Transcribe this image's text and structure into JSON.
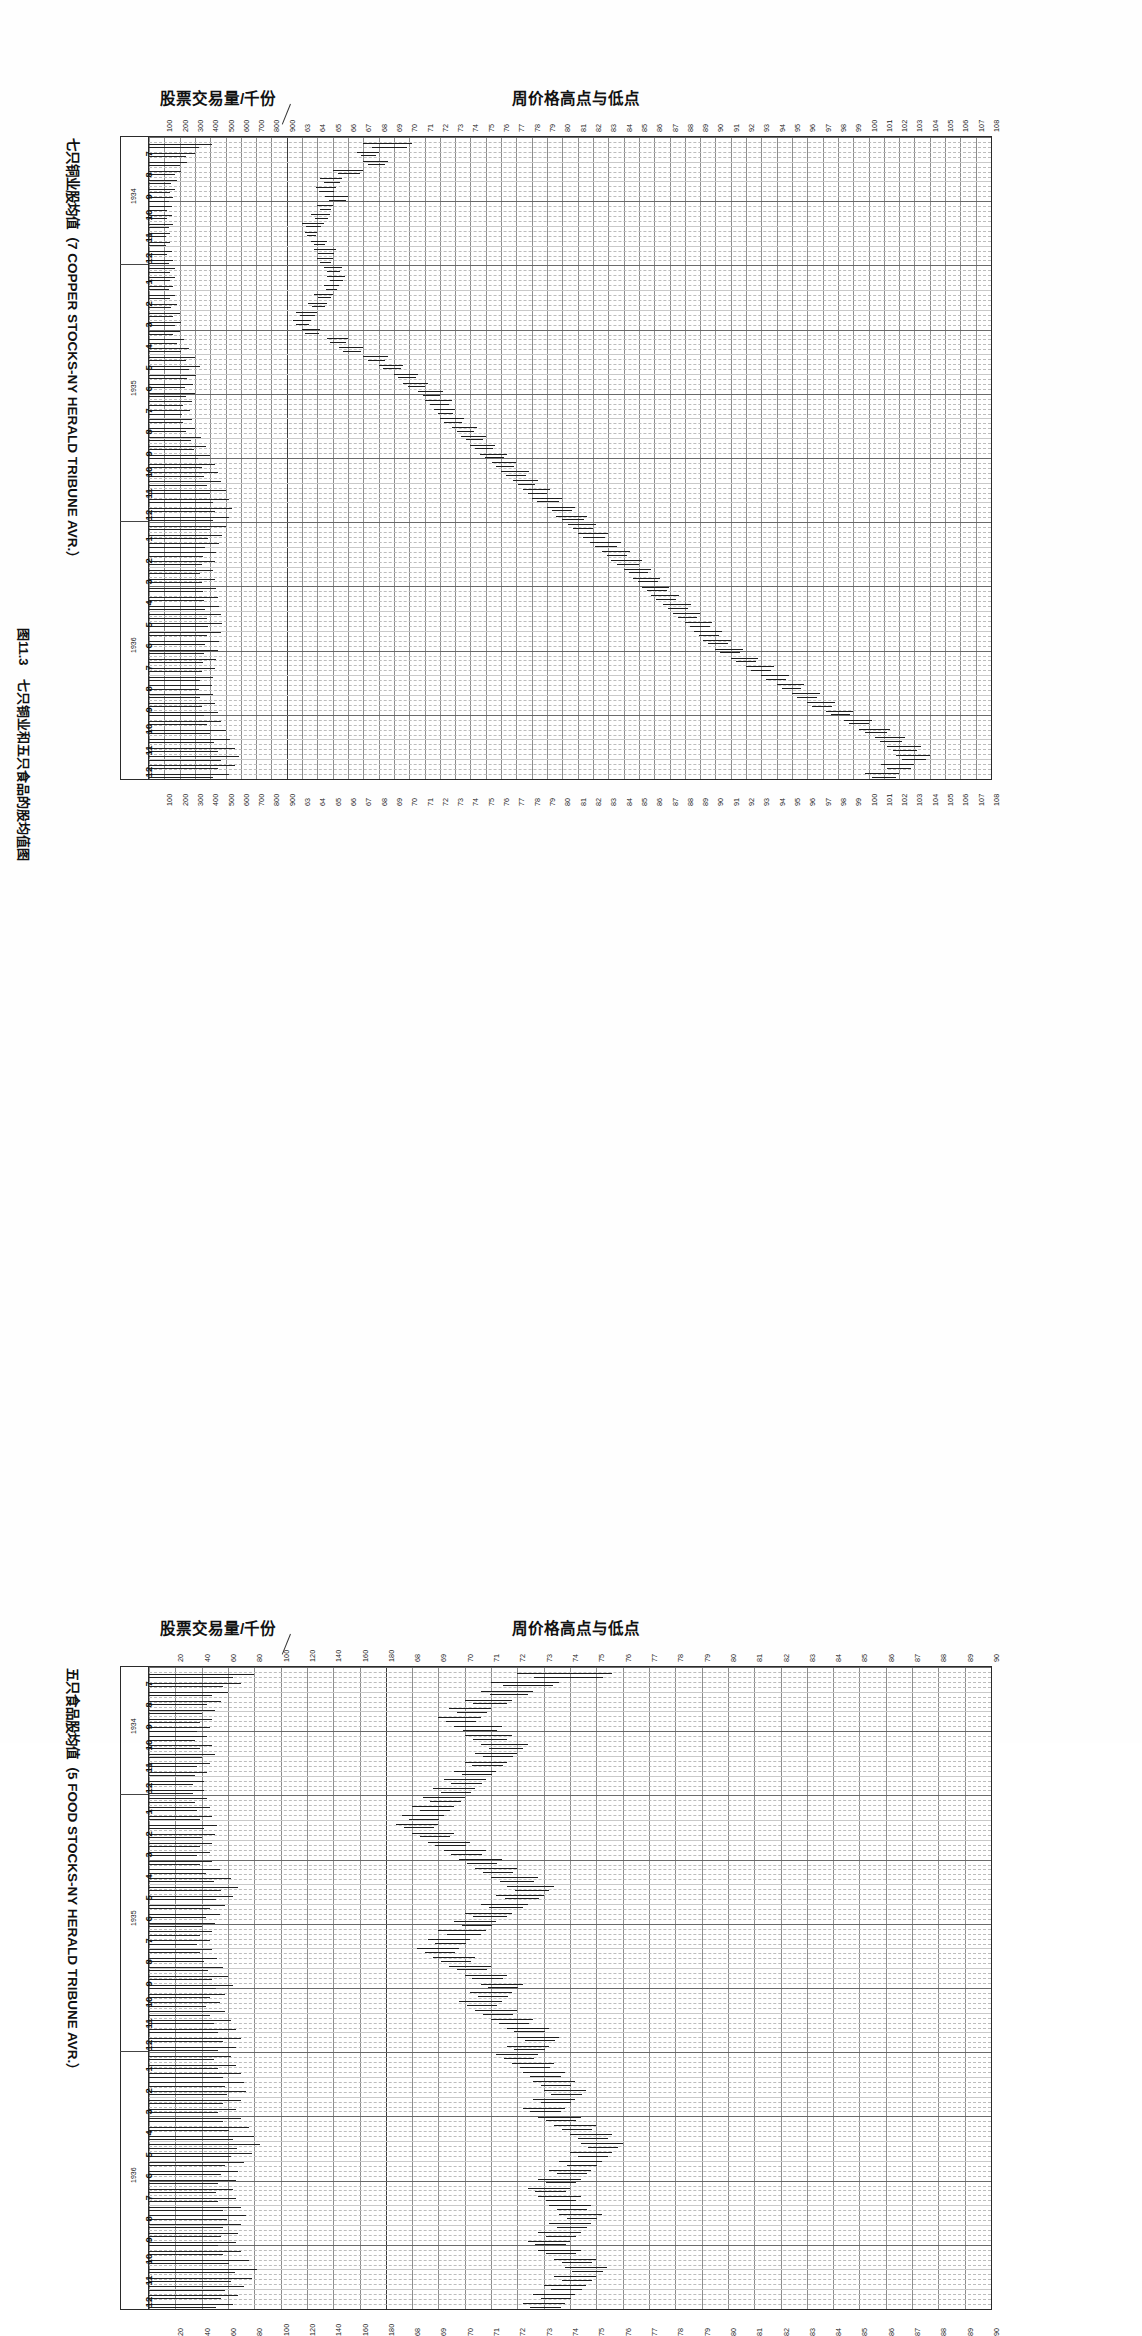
{
  "figure": {
    "caption": "图11.3　七只铜业和五只食品的股均值图",
    "volume_axis_title": "股票交易量/千份",
    "price_axis_title": "周价格高点与低点"
  },
  "charts": [
    {
      "id": "copper",
      "side_title": "七只铜业股均值（7 COPPER STOCKS-NY HERALD TRIBUNE AVR.）",
      "volume_axis_title": "股票交易量/千份",
      "price_axis_title": "周价格高点与低点",
      "volume_ticks": [
        "100",
        "200",
        "300",
        "400",
        "500",
        "600",
        "700",
        "800",
        "900"
      ],
      "price_ticks": [
        "63",
        "64",
        "65",
        "66",
        "67",
        "68",
        "69",
        "70",
        "71",
        "72",
        "73",
        "74",
        "75",
        "76",
        "77",
        "78",
        "79",
        "80",
        "81",
        "82",
        "83",
        "84",
        "85",
        "86",
        "87",
        "88",
        "89",
        "90",
        "91",
        "92",
        "93",
        "94",
        "95",
        "96",
        "97",
        "98",
        "99",
        "100",
        "101",
        "102",
        "103",
        "104",
        "105",
        "106",
        "107",
        "108"
      ],
      "years": [
        "1934",
        "1935",
        "1936"
      ],
      "month_labels_1934": [
        "7",
        "8",
        "9",
        "10",
        "11",
        "12"
      ],
      "month_labels_1935": [
        "1",
        "2",
        "3",
        "4",
        "5",
        "6",
        "7",
        "8",
        "9",
        "10",
        "11",
        "12"
      ],
      "month_labels_1936": [
        "1",
        "2",
        "3",
        "4",
        "5",
        "6",
        "7",
        "8",
        "9",
        "10",
        "11",
        "12"
      ]
    },
    {
      "id": "food",
      "side_title": "五只食品股均值（5 FOOD STOCKS-NY HERALD TRIBUNE AVR.）",
      "volume_axis_title": "股票交易量/千份",
      "price_axis_title": "周价格高点与低点",
      "volume_ticks": [
        "20",
        "40",
        "60",
        "80",
        "100",
        "120",
        "140",
        "160",
        "180"
      ],
      "price_ticks": [
        "68",
        "69",
        "70",
        "71",
        "72",
        "73",
        "74",
        "75",
        "76",
        "77",
        "78",
        "79",
        "80",
        "81",
        "82",
        "83",
        "84",
        "85",
        "86",
        "87",
        "88",
        "89",
        "90"
      ],
      "years": [
        "1934",
        "1935",
        "1936"
      ],
      "month_labels_1934": [
        "7",
        "8",
        "9",
        "10",
        "11",
        "12"
      ],
      "month_labels_1935": [
        "1",
        "2",
        "3",
        "4",
        "5",
        "6",
        "7",
        "8",
        "9",
        "10",
        "11",
        "12"
      ],
      "month_labels_1936": [
        "1",
        "2",
        "3",
        "4",
        "5",
        "6",
        "7",
        "8",
        "9",
        "10",
        "11",
        "12"
      ]
    }
  ],
  "chart_data": [
    {
      "type": "bar",
      "id": "copper",
      "title": "七只铜业股均值（7 COPPER STOCKS-NY HERALD TRIBUNE AVR.）",
      "subtitle": "Weekly price highs and lows with share volume",
      "xlabel": "周价格高点与低点",
      "ylabel": "日期（月/年）",
      "orientation": "horizontal-time-down",
      "grid": true,
      "legend": "none",
      "price_axis_label": "周价格高点与低点",
      "price_range": [
        63,
        108
      ],
      "volume_axis_label": "股票交易量/千份",
      "volume_range": [
        0,
        900
      ],
      "time_range": [
        "1934-07",
        "1936-12"
      ],
      "weekly_bars": [
        {
          "w": 1,
          "low": 68.0,
          "high": 71.2,
          "vol": 410
        },
        {
          "w": 2,
          "low": 67.6,
          "high": 69.0,
          "vol": 300
        },
        {
          "w": 3,
          "low": 68.0,
          "high": 69.6,
          "vol": 250
        },
        {
          "w": 4,
          "low": 66.0,
          "high": 68.0,
          "vol": 210
        },
        {
          "w": 5,
          "low": 65.2,
          "high": 66.6,
          "vol": 180
        },
        {
          "w": 6,
          "low": 64.9,
          "high": 66.2,
          "vol": 170
        },
        {
          "w": 7,
          "low": 65.5,
          "high": 67.0,
          "vol": 160
        },
        {
          "w": 8,
          "low": 65.0,
          "high": 66.0,
          "vol": 150
        },
        {
          "w": 9,
          "low": 64.6,
          "high": 65.8,
          "vol": 150
        },
        {
          "w": 10,
          "low": 64.0,
          "high": 65.4,
          "vol": 160
        },
        {
          "w": 11,
          "low": 64.2,
          "high": 65.0,
          "vol": 140
        },
        {
          "w": 12,
          "low": 64.6,
          "high": 65.6,
          "vol": 140
        },
        {
          "w": 13,
          "low": 64.8,
          "high": 66.2,
          "vol": 150
        },
        {
          "w": 14,
          "low": 65.0,
          "high": 66.0,
          "vol": 160
        },
        {
          "w": 15,
          "low": 65.4,
          "high": 66.6,
          "vol": 170
        },
        {
          "w": 16,
          "low": 65.6,
          "high": 66.8,
          "vol": 170
        },
        {
          "w": 17,
          "low": 65.4,
          "high": 66.4,
          "vol": 160
        },
        {
          "w": 18,
          "low": 64.8,
          "high": 66.0,
          "vol": 170
        },
        {
          "w": 19,
          "low": 64.4,
          "high": 65.6,
          "vol": 180
        },
        {
          "w": 20,
          "low": 63.6,
          "high": 65.0,
          "vol": 200
        },
        {
          "w": 21,
          "low": 63.4,
          "high": 64.6,
          "vol": 210
        },
        {
          "w": 22,
          "low": 64.0,
          "high": 65.2,
          "vol": 200
        },
        {
          "w": 23,
          "low": 65.6,
          "high": 67.0,
          "vol": 230
        },
        {
          "w": 24,
          "low": 66.4,
          "high": 68.0,
          "vol": 260
        },
        {
          "w": 25,
          "low": 68.0,
          "high": 69.6,
          "vol": 300
        },
        {
          "w": 26,
          "low": 69.0,
          "high": 70.6,
          "vol": 330
        },
        {
          "w": 27,
          "low": 70.0,
          "high": 71.6,
          "vol": 310
        },
        {
          "w": 28,
          "low": 70.6,
          "high": 72.2,
          "vol": 290
        },
        {
          "w": 29,
          "low": 71.6,
          "high": 73.2,
          "vol": 300
        },
        {
          "w": 30,
          "low": 72.0,
          "high": 73.8,
          "vol": 280
        },
        {
          "w": 31,
          "low": 72.6,
          "high": 74.0,
          "vol": 270
        },
        {
          "w": 32,
          "low": 73.0,
          "high": 74.6,
          "vol": 280
        },
        {
          "w": 33,
          "low": 73.8,
          "high": 75.4,
          "vol": 300
        },
        {
          "w": 34,
          "low": 74.4,
          "high": 76.0,
          "vol": 340
        },
        {
          "w": 35,
          "low": 75.0,
          "high": 76.6,
          "vol": 370
        },
        {
          "w": 36,
          "low": 75.6,
          "high": 77.4,
          "vol": 400
        },
        {
          "w": 37,
          "low": 76.4,
          "high": 78.0,
          "vol": 430
        },
        {
          "w": 38,
          "low": 77.0,
          "high": 78.8,
          "vol": 450
        },
        {
          "w": 39,
          "low": 77.8,
          "high": 79.4,
          "vol": 470
        },
        {
          "w": 40,
          "low": 78.4,
          "high": 80.2,
          "vol": 500
        },
        {
          "w": 41,
          "low": 79.0,
          "high": 81.0,
          "vol": 520
        },
        {
          "w": 42,
          "low": 80.0,
          "high": 81.8,
          "vol": 540
        },
        {
          "w": 43,
          "low": 80.6,
          "high": 82.6,
          "vol": 520
        },
        {
          "w": 44,
          "low": 81.4,
          "high": 83.2,
          "vol": 500
        },
        {
          "w": 45,
          "low": 82.0,
          "high": 84.0,
          "vol": 480
        },
        {
          "w": 46,
          "low": 82.8,
          "high": 84.8,
          "vol": 460
        },
        {
          "w": 47,
          "low": 83.6,
          "high": 85.4,
          "vol": 440
        },
        {
          "w": 48,
          "low": 84.2,
          "high": 86.2,
          "vol": 430
        },
        {
          "w": 49,
          "low": 85.0,
          "high": 86.8,
          "vol": 420
        },
        {
          "w": 50,
          "low": 85.6,
          "high": 87.4,
          "vol": 430
        },
        {
          "w": 51,
          "low": 86.2,
          "high": 88.0,
          "vol": 440
        },
        {
          "w": 52,
          "low": 86.8,
          "high": 88.6,
          "vol": 450
        },
        {
          "w": 53,
          "low": 87.6,
          "high": 89.4,
          "vol": 460
        },
        {
          "w": 54,
          "low": 88.2,
          "high": 90.0,
          "vol": 470
        },
        {
          "w": 55,
          "low": 89.0,
          "high": 90.8,
          "vol": 480
        },
        {
          "w": 56,
          "low": 89.6,
          "high": 91.4,
          "vol": 470
        },
        {
          "w": 57,
          "low": 90.2,
          "high": 92.0,
          "vol": 460
        },
        {
          "w": 58,
          "low": 91.0,
          "high": 92.8,
          "vol": 450
        },
        {
          "w": 59,
          "low": 92.0,
          "high": 93.8,
          "vol": 440
        },
        {
          "w": 60,
          "low": 93.0,
          "high": 94.8,
          "vol": 430
        },
        {
          "w": 61,
          "low": 94.0,
          "high": 95.8,
          "vol": 420
        },
        {
          "w": 62,
          "low": 95.0,
          "high": 96.8,
          "vol": 410
        },
        {
          "w": 63,
          "low": 96.0,
          "high": 97.8,
          "vol": 420
        },
        {
          "w": 64,
          "low": 97.0,
          "high": 98.8,
          "vol": 430
        },
        {
          "w": 65,
          "low": 98.2,
          "high": 100.0,
          "vol": 450
        },
        {
          "w": 66,
          "low": 99.4,
          "high": 101.2,
          "vol": 470
        },
        {
          "w": 67,
          "low": 100.4,
          "high": 102.4,
          "vol": 500
        },
        {
          "w": 68,
          "low": 101.4,
          "high": 103.4,
          "vol": 530
        },
        {
          "w": 69,
          "low": 102.2,
          "high": 104.4,
          "vol": 560
        },
        {
          "w": 70,
          "low": 102.8,
          "high": 105.0,
          "vol": 590
        },
        {
          "w": 71,
          "low": 101.8,
          "high": 104.0,
          "vol": 560
        },
        {
          "w": 72,
          "low": 100.8,
          "high": 103.0,
          "vol": 520
        }
      ]
    },
    {
      "type": "bar",
      "id": "food",
      "title": "五只食品股均值（5 FOOD STOCKS-NY HERALD TRIBUNE AVR.）",
      "subtitle": "Weekly price highs and lows with share volume",
      "xlabel": "周价格高点与低点",
      "ylabel": "日期（月/年）",
      "orientation": "horizontal-time-down",
      "grid": true,
      "legend": "none",
      "price_axis_label": "周价格高点与低点",
      "price_range": [
        68,
        90
      ],
      "volume_axis_label": "股票交易量/千份",
      "volume_range": [
        0,
        180
      ],
      "time_range": [
        "1934-07",
        "1936-12"
      ],
      "weekly_bars": [
        {
          "w": 1,
          "low": 73.0,
          "high": 76.6,
          "vol": 80
        },
        {
          "w": 2,
          "low": 72.0,
          "high": 74.6,
          "vol": 70
        },
        {
          "w": 3,
          "low": 71.6,
          "high": 73.6,
          "vol": 60
        },
        {
          "w": 4,
          "low": 71.0,
          "high": 72.8,
          "vol": 55
        },
        {
          "w": 5,
          "low": 70.4,
          "high": 72.0,
          "vol": 50
        },
        {
          "w": 6,
          "low": 70.0,
          "high": 71.6,
          "vol": 48
        },
        {
          "w": 7,
          "low": 70.6,
          "high": 72.4,
          "vol": 46
        },
        {
          "w": 8,
          "low": 71.0,
          "high": 72.8,
          "vol": 44
        },
        {
          "w": 9,
          "low": 71.6,
          "high": 73.4,
          "vol": 48
        },
        {
          "w": 10,
          "low": 71.4,
          "high": 73.0,
          "vol": 50
        },
        {
          "w": 11,
          "low": 71.0,
          "high": 72.6,
          "vol": 46
        },
        {
          "w": 12,
          "low": 70.6,
          "high": 72.2,
          "vol": 44
        },
        {
          "w": 13,
          "low": 70.2,
          "high": 71.8,
          "vol": 42
        },
        {
          "w": 14,
          "low": 69.8,
          "high": 71.4,
          "vol": 42
        },
        {
          "w": 15,
          "low": 69.4,
          "high": 71.0,
          "vol": 44
        },
        {
          "w": 16,
          "low": 69.0,
          "high": 70.6,
          "vol": 46
        },
        {
          "w": 17,
          "low": 68.6,
          "high": 70.2,
          "vol": 48
        },
        {
          "w": 18,
          "low": 68.4,
          "high": 70.0,
          "vol": 52
        },
        {
          "w": 19,
          "low": 69.0,
          "high": 70.6,
          "vol": 50
        },
        {
          "w": 20,
          "low": 69.6,
          "high": 71.2,
          "vol": 48
        },
        {
          "w": 21,
          "low": 70.2,
          "high": 71.8,
          "vol": 46
        },
        {
          "w": 22,
          "low": 70.8,
          "high": 72.4,
          "vol": 48
        },
        {
          "w": 23,
          "low": 71.4,
          "high": 73.0,
          "vol": 54
        },
        {
          "w": 24,
          "low": 72.0,
          "high": 73.8,
          "vol": 62
        },
        {
          "w": 25,
          "low": 72.6,
          "high": 74.4,
          "vol": 68
        },
        {
          "w": 26,
          "low": 72.2,
          "high": 74.0,
          "vol": 64
        },
        {
          "w": 27,
          "low": 71.6,
          "high": 73.4,
          "vol": 58
        },
        {
          "w": 28,
          "low": 71.0,
          "high": 72.8,
          "vol": 54
        },
        {
          "w": 29,
          "low": 70.6,
          "high": 72.2,
          "vol": 50
        },
        {
          "w": 30,
          "low": 70.0,
          "high": 71.8,
          "vol": 48
        },
        {
          "w": 31,
          "low": 69.6,
          "high": 71.2,
          "vol": 46
        },
        {
          "w": 32,
          "low": 69.2,
          "high": 70.8,
          "vol": 48
        },
        {
          "w": 33,
          "low": 69.8,
          "high": 71.4,
          "vol": 52
        },
        {
          "w": 34,
          "low": 70.4,
          "high": 72.0,
          "vol": 56
        },
        {
          "w": 35,
          "low": 71.0,
          "high": 72.6,
          "vol": 60
        },
        {
          "w": 36,
          "low": 71.6,
          "high": 73.2,
          "vol": 64
        },
        {
          "w": 37,
          "low": 71.2,
          "high": 72.8,
          "vol": 58
        },
        {
          "w": 38,
          "low": 70.8,
          "high": 72.4,
          "vol": 54
        },
        {
          "w": 39,
          "low": 71.4,
          "high": 73.0,
          "vol": 58
        },
        {
          "w": 40,
          "low": 72.0,
          "high": 73.6,
          "vol": 62
        },
        {
          "w": 41,
          "low": 72.6,
          "high": 74.2,
          "vol": 66
        },
        {
          "w": 42,
          "low": 73.0,
          "high": 74.6,
          "vol": 70
        },
        {
          "w": 43,
          "low": 72.6,
          "high": 74.2,
          "vol": 66
        },
        {
          "w": 44,
          "low": 72.2,
          "high": 73.8,
          "vol": 62
        },
        {
          "w": 45,
          "low": 72.8,
          "high": 74.4,
          "vol": 66
        },
        {
          "w": 46,
          "low": 73.2,
          "high": 74.8,
          "vol": 70
        },
        {
          "w": 47,
          "low": 73.6,
          "high": 75.2,
          "vol": 72
        },
        {
          "w": 48,
          "low": 74.0,
          "high": 75.6,
          "vol": 74
        },
        {
          "w": 49,
          "low": 73.6,
          "high": 75.2,
          "vol": 70
        },
        {
          "w": 50,
          "low": 73.2,
          "high": 74.8,
          "vol": 66
        },
        {
          "w": 51,
          "low": 73.8,
          "high": 75.4,
          "vol": 70
        },
        {
          "w": 52,
          "low": 74.4,
          "high": 76.0,
          "vol": 76
        },
        {
          "w": 53,
          "low": 75.0,
          "high": 76.6,
          "vol": 80
        },
        {
          "w": 54,
          "low": 75.4,
          "high": 77.0,
          "vol": 84
        },
        {
          "w": 55,
          "low": 75.0,
          "high": 76.6,
          "vol": 78
        },
        {
          "w": 56,
          "low": 74.6,
          "high": 76.2,
          "vol": 72
        },
        {
          "w": 57,
          "low": 74.2,
          "high": 75.8,
          "vol": 68
        },
        {
          "w": 58,
          "low": 73.8,
          "high": 75.4,
          "vol": 66
        },
        {
          "w": 59,
          "low": 73.4,
          "high": 75.0,
          "vol": 64
        },
        {
          "w": 60,
          "low": 73.8,
          "high": 75.4,
          "vol": 66
        },
        {
          "w": 61,
          "low": 74.2,
          "high": 75.8,
          "vol": 70
        },
        {
          "w": 62,
          "low": 74.6,
          "high": 76.2,
          "vol": 74
        },
        {
          "w": 63,
          "low": 74.2,
          "high": 75.8,
          "vol": 70
        },
        {
          "w": 64,
          "low": 73.8,
          "high": 75.4,
          "vol": 68
        },
        {
          "w": 65,
          "low": 73.4,
          "high": 75.0,
          "vol": 66
        },
        {
          "w": 66,
          "low": 73.8,
          "high": 75.4,
          "vol": 70
        },
        {
          "w": 67,
          "low": 74.4,
          "high": 76.0,
          "vol": 76
        },
        {
          "w": 68,
          "low": 74.8,
          "high": 76.4,
          "vol": 82
        },
        {
          "w": 69,
          "low": 74.4,
          "high": 76.0,
          "vol": 78
        },
        {
          "w": 70,
          "low": 74.0,
          "high": 75.6,
          "vol": 72
        },
        {
          "w": 71,
          "low": 73.6,
          "high": 75.2,
          "vol": 68
        },
        {
          "w": 72,
          "low": 73.2,
          "high": 74.8,
          "vol": 64
        }
      ]
    }
  ]
}
